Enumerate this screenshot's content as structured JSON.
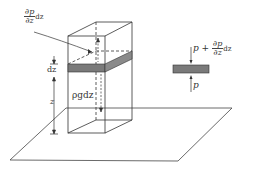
{
  "diagram": {
    "labels": {
      "gradient_term": {
        "num": "∂p",
        "den": "∂z",
        "suffix": "dz"
      },
      "dz": "dz",
      "z": "z",
      "weight": "ρgdz",
      "top_force": {
        "prefix": "p +",
        "num": "∂p",
        "den": "∂z",
        "suffix": "dz"
      },
      "bottom_force": "p"
    },
    "colors": {
      "line": "#333333",
      "slab": "#7a7a7a",
      "background": "#ffffff"
    }
  }
}
